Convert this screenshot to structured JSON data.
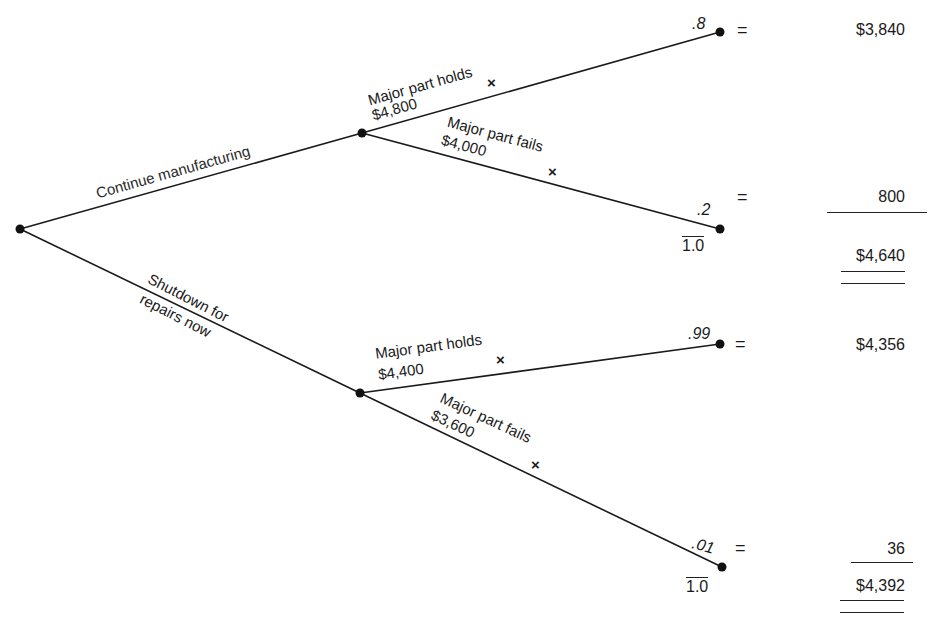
{
  "decision": {
    "root_node": "decision-point",
    "branches": [
      {
        "label": "Continue manufacturing",
        "outcomes": [
          {
            "label": "Major part holds",
            "payoff": "$4,800",
            "probability": ".8",
            "expected": "$3,840",
            "marker": "×"
          },
          {
            "label": "Major part fails",
            "payoff": "$4,000",
            "probability": ".2",
            "expected": "800",
            "marker": "×"
          }
        ],
        "probability_total": "1.0",
        "expected_total": "$4,640"
      },
      {
        "label_line1": "Shutdown for",
        "label_line2": "repairs now",
        "outcomes": [
          {
            "label": "Major part holds",
            "payoff": "$4,400",
            "probability": ".99",
            "expected": "$4,356",
            "marker": "×"
          },
          {
            "label": "Major part fails",
            "payoff": "$3,600",
            "probability": ".01",
            "expected": "36",
            "marker": "×"
          }
        ],
        "probability_total": "1.0",
        "expected_total": "$4,392"
      }
    ],
    "equals_sign": "="
  },
  "colors": {
    "line": "#1a1a1a",
    "node": "#111111",
    "background": "#ffffff"
  }
}
